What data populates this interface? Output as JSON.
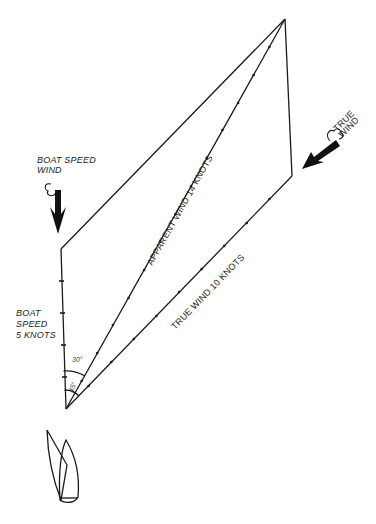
{
  "diagram": {
    "type": "wind-vector-triangle",
    "labels": {
      "boat_speed_wind": [
        "BOAT SPEED",
        "WIND"
      ],
      "true_wind_arrow": [
        "TRUE",
        "WIND"
      ],
      "boat_speed": [
        "BOAT",
        "SPEED",
        "5 KNOTS"
      ],
      "apparent_wind": "APPARENT WIND 14 KNOTS",
      "true_wind": "TRUE WIND 10 KNOTS",
      "angle_outer": "30°",
      "angle_inner": "45°"
    },
    "vectors": [
      {
        "name": "Boat speed",
        "knots": 5
      },
      {
        "name": "True wind",
        "knots": 10
      },
      {
        "name": "Apparent wind",
        "knots": 14
      }
    ],
    "colors": {
      "ink": "#1a1a1a",
      "background": "#ffffff"
    }
  }
}
